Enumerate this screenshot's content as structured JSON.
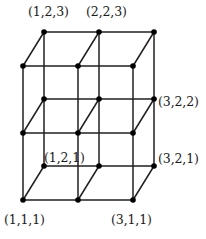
{
  "figure": {
    "kind": "3d-integer-lattice-grid",
    "background_color": "#ffffff",
    "edge_color": "#231f20",
    "vertex_color": "#000000",
    "label_color": "#1a1a1a",
    "projection": {
      "x_step_px": 55,
      "z_step_px": 67,
      "depth_offset_x_px": 21,
      "depth_offset_y_px": -34
    },
    "origin_px": {
      "x": 23,
      "y": 200
    },
    "dimensions": {
      "x_values": [
        1,
        2,
        3
      ],
      "y_values": [
        1,
        2
      ],
      "z_values": [
        1,
        2,
        3
      ]
    },
    "vertex_radius_px": 2.8,
    "edge_width_px": 1.5
  },
  "labels": [
    {
      "name": "label-1-2-3",
      "text": "(1,2,3)",
      "left": 28,
      "top": 6,
      "anchor_vertex": "1,2,3"
    },
    {
      "name": "label-2-2-3",
      "text": "(2,2,3)",
      "left": 86,
      "top": 6,
      "anchor_vertex": "2,2,3"
    },
    {
      "name": "label-3-2-2",
      "text": "(3,2,2)",
      "left": 158,
      "top": 96,
      "anchor_vertex": "3,2,2"
    },
    {
      "name": "label-3-2-1",
      "text": "(3,2,1)",
      "left": 158,
      "top": 153,
      "anchor_vertex": "3,2,1"
    },
    {
      "name": "label-1-2-1",
      "text": "(1,2,1)",
      "left": 44,
      "top": 152,
      "anchor_vertex": "1,2,1"
    },
    {
      "name": "label-1-1-1",
      "text": "(1,1,1)",
      "left": 4,
      "top": 214,
      "anchor_vertex": "1,1,1"
    },
    {
      "name": "label-3-1-1",
      "text": "(3,1,1)",
      "left": 111,
      "top": 214,
      "anchor_vertex": "3,1,1"
    }
  ]
}
